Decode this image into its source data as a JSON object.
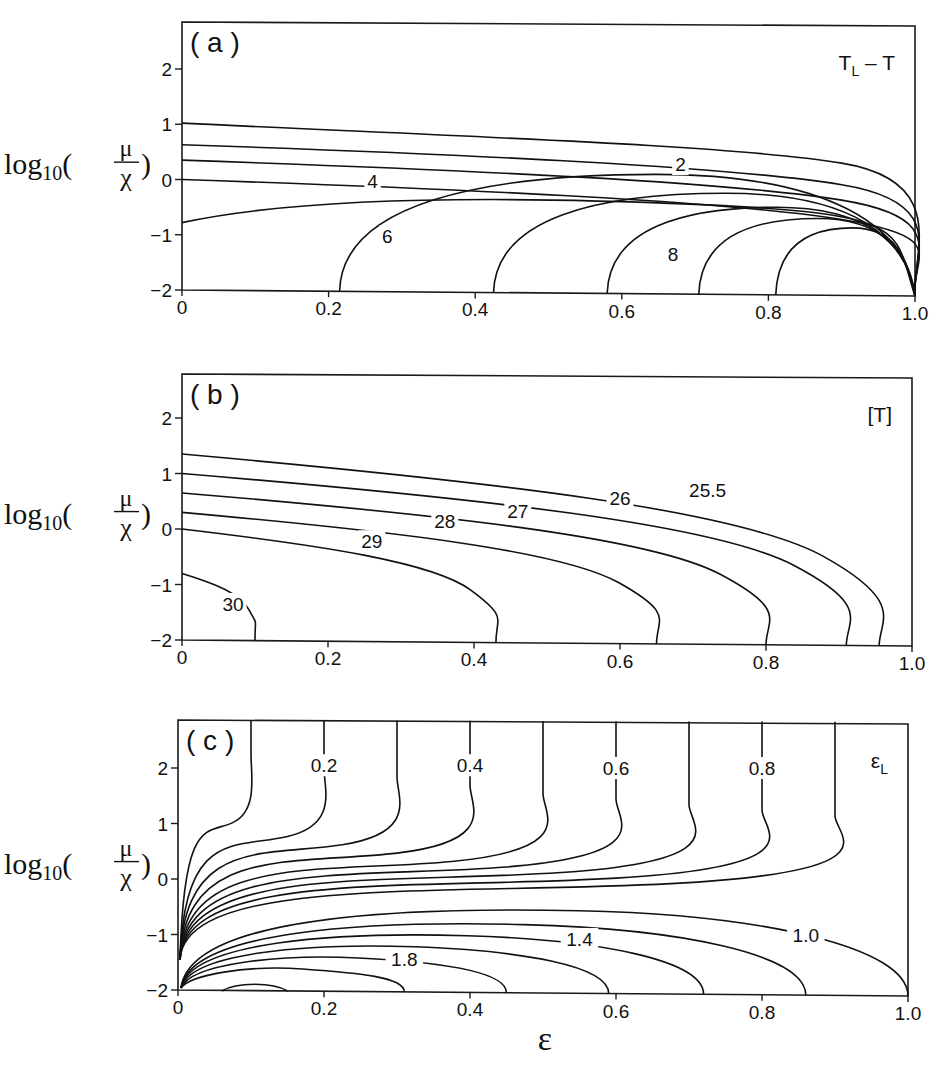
{
  "figure": {
    "y_axis_label": {
      "prefix": "log",
      "subscript": "10",
      "numerator": "μ",
      "denominator": "χ"
    },
    "x_axis_label": "ε"
  },
  "chart_data": [
    {
      "type": "contour",
      "panel": "(a)",
      "quantity_label": {
        "main": "T",
        "subscript": "L",
        "suffix": " – T"
      },
      "xlabel": "",
      "ylabel": "log10(μ/χ)",
      "xlim": [
        0,
        1.0
      ],
      "ylim": [
        -2,
        2.7
      ],
      "x_ticks": [
        "0",
        "0.2",
        "0.4",
        "0.6",
        "0.8",
        "1.0"
      ],
      "y_ticks": [
        "2",
        "1",
        "0",
        "−1",
        "−2"
      ],
      "contour_labels": [
        {
          "text": "2",
          "x": 0.68,
          "y": 0.28
        },
        {
          "text": "4",
          "x": 0.26,
          "y": -0.02
        },
        {
          "text": "6",
          "x": 0.28,
          "y": -1.03
        },
        {
          "text": "8",
          "x": 0.67,
          "y": -1.35
        }
      ],
      "contours": [
        {
          "level": 1,
          "start_y": 1.02
        },
        {
          "level": 2,
          "start_y": 0.63
        },
        {
          "level": 3,
          "start_y": 0.35
        },
        {
          "level": 4,
          "start_y": 0.0
        },
        {
          "level": 5,
          "start_y": -0.78
        },
        {
          "level": 6,
          "foot_x": 0.215
        },
        {
          "level": 7,
          "foot_x": 0.425
        },
        {
          "level": 8,
          "foot_x": 0.58
        },
        {
          "level": 9,
          "foot_x": 0.705
        },
        {
          "level": 10,
          "foot_x": 0.81
        }
      ],
      "grid": false
    },
    {
      "type": "contour",
      "panel": "(b)",
      "quantity_label": {
        "main": "[T]"
      },
      "xlabel": "",
      "ylabel": "log10(μ/χ)",
      "xlim": [
        0,
        1.0
      ],
      "ylim": [
        -2,
        2.7
      ],
      "x_ticks": [
        "0",
        "0.2",
        "0.4",
        "0.6",
        "0.8",
        "1.0"
      ],
      "y_ticks": [
        "2",
        "1",
        "0",
        "−1",
        "−2"
      ],
      "contour_labels": [
        {
          "text": "25.5",
          "x": 0.72,
          "y": 0.7
        },
        {
          "text": "26",
          "x": 0.6,
          "y": 0.55
        },
        {
          "text": "27",
          "x": 0.46,
          "y": 0.33
        },
        {
          "text": "28",
          "x": 0.36,
          "y": 0.14
        },
        {
          "text": "29",
          "x": 0.26,
          "y": -0.22
        },
        {
          "text": "30",
          "x": 0.07,
          "y": -1.35
        }
      ],
      "contours": [
        {
          "level": 25.5,
          "start_y": 1.35,
          "foot_x": 0.955
        },
        {
          "level": 26,
          "start_y": 1.0,
          "foot_x": 0.91
        },
        {
          "level": 27,
          "start_y": 0.65,
          "foot_x": 0.8
        },
        {
          "level": 28,
          "start_y": 0.3,
          "foot_x": 0.65
        },
        {
          "level": 29,
          "start_y": 0.0,
          "foot_x": 0.43
        },
        {
          "level": 30,
          "start_y": -0.8,
          "foot_x": 0.1
        }
      ],
      "grid": false
    },
    {
      "type": "contour",
      "panel": "(c)",
      "quantity_label": {
        "main": "ε",
        "subscript": "L"
      },
      "xlabel": "ε",
      "ylabel": "log10(μ/χ)",
      "xlim": [
        0,
        1.0
      ],
      "ylim": [
        -2,
        2.7
      ],
      "x_ticks": [
        "0",
        "0.2",
        "0.4",
        "0.6",
        "0.8",
        "1.0"
      ],
      "y_ticks": [
        "2",
        "1",
        "0",
        "−1",
        "−2"
      ],
      "contour_labels": [
        {
          "text": "0.2",
          "x": 0.2,
          "y": 2.05
        },
        {
          "text": "0.4",
          "x": 0.4,
          "y": 2.05
        },
        {
          "text": "0.6",
          "x": 0.6,
          "y": 2.0
        },
        {
          "text": "0.8",
          "x": 0.8,
          "y": 2.0
        },
        {
          "text": "1.0",
          "x": 0.86,
          "y": -1.0
        },
        {
          "text": "1.4",
          "x": 0.55,
          "y": -1.08
        },
        {
          "text": "1.8",
          "x": 0.31,
          "y": -1.45
        }
      ],
      "contours": [
        {
          "level": 0.1,
          "top_x": 0.1,
          "knee_y": 0.8
        },
        {
          "level": 0.2,
          "top_x": 0.2,
          "knee_y": 0.55
        },
        {
          "level": 0.3,
          "top_x": 0.3,
          "knee_y": 0.4
        },
        {
          "level": 0.4,
          "top_x": 0.4,
          "knee_y": 0.25
        },
        {
          "level": 0.5,
          "top_x": 0.5,
          "knee_y": 0.1
        },
        {
          "level": 0.6,
          "top_x": 0.6,
          "knee_y": 0.0
        },
        {
          "level": 0.7,
          "top_x": 0.7,
          "knee_y": -0.1
        },
        {
          "level": 0.8,
          "top_x": 0.8,
          "knee_y": -0.2
        },
        {
          "level": 0.9,
          "top_x": 0.9,
          "knee_y": -0.3
        },
        {
          "level": 1.0,
          "foot_x": 1.0,
          "peak_y": -0.5
        },
        {
          "level": 1.2,
          "foot_x": 0.86,
          "peak_y": -0.75
        },
        {
          "level": 1.4,
          "foot_x": 0.72,
          "peak_y": -0.95
        },
        {
          "level": 1.6,
          "foot_x": 0.59,
          "peak_y": -1.15
        },
        {
          "level": 1.8,
          "foot_x": 0.45,
          "peak_y": -1.35
        },
        {
          "level": 2.0,
          "foot_x": 0.31,
          "peak_y": -1.55
        },
        {
          "level": 2.2,
          "foot_x": 0.15,
          "start_x": 0.06,
          "peak_y": -1.9
        }
      ],
      "grid": false
    }
  ]
}
